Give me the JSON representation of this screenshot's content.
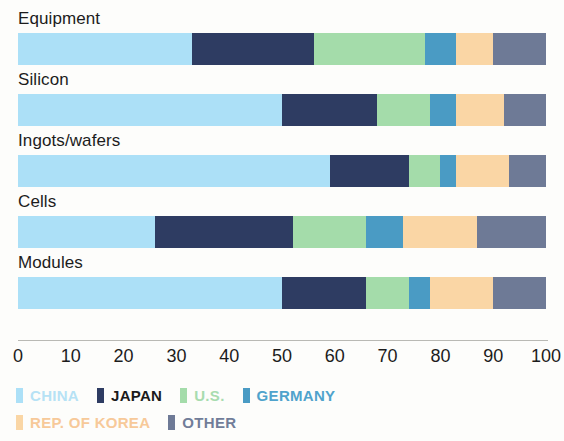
{
  "chart_data": {
    "type": "bar",
    "orientation": "horizontal",
    "stacked": true,
    "normalized": true,
    "title": "",
    "subtitle": "",
    "xlabel": "",
    "ylabel": "",
    "xlim": [
      0,
      100
    ],
    "xticks": [
      0,
      10,
      20,
      30,
      40,
      50,
      60,
      70,
      80,
      90,
      100
    ],
    "xtick_labels": [
      "0",
      "10",
      "20",
      "30",
      "40",
      "50",
      "60",
      "70",
      "80",
      "90",
      "100"
    ],
    "grid": false,
    "legend_position": "bottom-left",
    "categories": [
      "Equipment",
      "Silicon",
      "Ingots/wafers",
      "Cells",
      "Modules"
    ],
    "series": [
      {
        "name": "CHINA",
        "color": "#ace0f7",
        "values": [
          33,
          50,
          59,
          26,
          50
        ]
      },
      {
        "name": "JAPAN",
        "color": "#2e3c62",
        "values": [
          23,
          18,
          15,
          26,
          16
        ]
      },
      {
        "name": "U.S.",
        "color": "#a4dcaa",
        "values": [
          21,
          10,
          6,
          14,
          8
        ]
      },
      {
        "name": "GERMANY",
        "color": "#4a9bc4",
        "values": [
          6,
          5,
          3,
          7,
          4
        ]
      },
      {
        "name": "REP. OF KOREA",
        "color": "#fad6a5",
        "values": [
          7,
          9,
          10,
          14,
          12
        ]
      },
      {
        "name": "OTHER",
        "color": "#6e7a96",
        "values": [
          10,
          8,
          7,
          13,
          10
        ]
      }
    ]
  },
  "legend": {
    "rows": [
      [
        {
          "label": "CHINA",
          "color": "#ace0f7",
          "text_color": "#b6e2f5"
        },
        {
          "label": "JAPAN",
          "color": "#2e3c62",
          "text_color": "#1b1b1b"
        },
        {
          "label": "U.S.",
          "color": "#a4dcaa",
          "text_color": "#a8dcaf"
        },
        {
          "label": "GERMANY",
          "color": "#4a9bc4",
          "text_color": "#4fa3cc"
        }
      ],
      [
        {
          "label": "REP. OF KOREA",
          "color": "#fad6a5",
          "text_color": "#f7c999"
        },
        {
          "label": "OTHER",
          "color": "#6e7a96",
          "text_color": "#717d99"
        }
      ]
    ]
  }
}
